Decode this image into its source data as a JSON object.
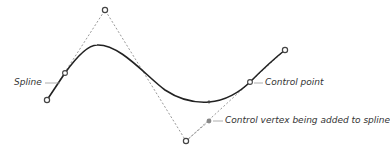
{
  "labels": {
    "spline": "Spline",
    "control_point": "Control point",
    "new_vertex": "Control vertex being added to spline"
  },
  "colors": {
    "curve": "#222222",
    "hull": "#999999",
    "vertex_stroke": "#444444",
    "new_vertex_fill": "#888888",
    "label_text": "#333333",
    "leader": "#999999"
  },
  "control_vertices": [
    {
      "x": 47,
      "y": 100
    },
    {
      "x": 105,
      "y": 10
    },
    {
      "x": 186,
      "y": 141
    },
    {
      "x": 285,
      "y": 50
    }
  ],
  "curve_points": [
    {
      "x": 65,
      "y": 73
    },
    {
      "x": 209,
      "y": 102
    },
    {
      "x": 250,
      "y": 82
    }
  ],
  "new_vertex": {
    "x": 209,
    "y": 121
  }
}
